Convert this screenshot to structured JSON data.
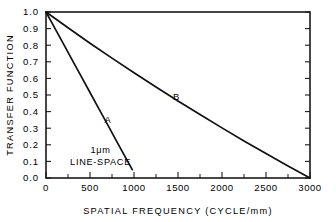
{
  "chart_data": {
    "type": "line",
    "title": "",
    "xlabel": "SPATIAL FREQUENCY (CYCLE/mm)",
    "ylabel": "TRANSFER FUNCTION",
    "xlim": [
      0,
      3000
    ],
    "ylim": [
      0.0,
      1.0
    ],
    "grid": false,
    "legend_position": "inline-curve-labels",
    "xticks": [
      0,
      500,
      1000,
      1500,
      2000,
      2500,
      3000
    ],
    "xticklabels": [
      "0",
      "500",
      "1000",
      "1500",
      "2000",
      "2500",
      "3000"
    ],
    "xminor_step": 250,
    "yticks": [
      0.0,
      0.1,
      0.2,
      0.3,
      0.4,
      0.5,
      0.6,
      0.7,
      0.8,
      0.9,
      1.0
    ],
    "yticklabels": [
      "0.0",
      "0.1",
      "0.2",
      "0.3",
      "0.4",
      "0.5",
      "0.6",
      "0.7",
      "0.8",
      "0.9",
      "1.0"
    ],
    "series": [
      {
        "name": "A",
        "label": "A",
        "type": "line",
        "x": [
          0,
          100,
          200,
          300,
          400,
          500,
          600,
          700,
          800,
          900,
          980
        ],
        "values": [
          1.0,
          0.903,
          0.806,
          0.709,
          0.612,
          0.515,
          0.418,
          0.321,
          0.224,
          0.127,
          0.05
        ],
        "label_x": 700,
        "label_y": 0.33
      },
      {
        "name": "B",
        "label": "B",
        "type": "line",
        "x": [
          0,
          250,
          500,
          750,
          1000,
          1250,
          1500,
          1750,
          2000,
          2250,
          2500,
          2750,
          3000
        ],
        "values": [
          1.0,
          0.905,
          0.812,
          0.722,
          0.634,
          0.548,
          0.464,
          0.382,
          0.302,
          0.223,
          0.147,
          0.072,
          0.0
        ],
        "label_x": 1480,
        "label_y": 0.47
      }
    ],
    "annotations": [
      {
        "name": "line-space-annotation",
        "line1": "1μm",
        "line2": "LINE-SPACE",
        "x": 620,
        "y": 0.15
      }
    ]
  },
  "axes": {
    "ylabel": "TRANSFER FUNCTION",
    "xlabel": "SPATIAL FREQUENCY (CYCLE/mm)"
  }
}
